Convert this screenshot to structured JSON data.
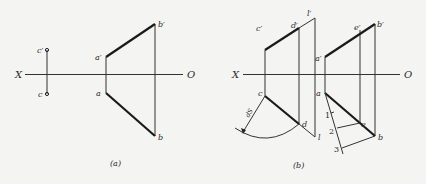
{
  "panels": [
    {
      "id": "a",
      "caption": "(a)",
      "axis": {
        "left_label": "X",
        "right_label": "O"
      },
      "labels": {
        "c_prime": "c′",
        "c": "c",
        "a_prime": "a′",
        "a": "a",
        "b_prime": "b′",
        "b": "b"
      }
    },
    {
      "id": "b",
      "caption": "(b)",
      "axis": {
        "left_label": "X",
        "right_label": "O"
      },
      "labels": {
        "c_prime": "c′",
        "d_prime": "d′",
        "l_prime": "l′",
        "c": "c",
        "d": "d",
        "l": "l",
        "dS": "dS",
        "a_prime": "a′",
        "e_prime": "e′",
        "b_prime": "b′",
        "a": "a",
        "e": "e",
        "b": "b",
        "div1": "1",
        "div2": "2",
        "div3": "3"
      }
    }
  ]
}
